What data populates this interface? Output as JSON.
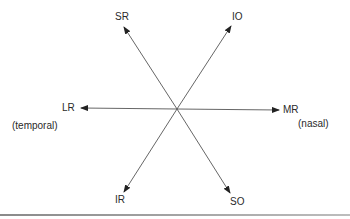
{
  "diagram": {
    "type": "extraocular-muscle-actions",
    "center": {
      "x": 177,
      "y": 109
    },
    "colors": {
      "line": "#555555",
      "arrowhead": "#222222",
      "text": "#2a2a2a"
    },
    "arrows": [
      {
        "id": "sr",
        "label": "SR",
        "tip": {
          "x": 124,
          "y": 27
        }
      },
      {
        "id": "io",
        "label": "IO",
        "tip": {
          "x": 231,
          "y": 26
        }
      },
      {
        "id": "lr",
        "label": "LR",
        "tip": {
          "x": 81,
          "y": 108
        }
      },
      {
        "id": "mr",
        "label": "MR",
        "tip": {
          "x": 279,
          "y": 110
        }
      },
      {
        "id": "ir",
        "label": "IR",
        "tip": {
          "x": 124,
          "y": 192
        }
      },
      {
        "id": "so",
        "label": "SO",
        "tip": {
          "x": 230,
          "y": 193
        }
      }
    ],
    "side_labels": {
      "temporal": "(temporal)",
      "nasal": "(nasal)"
    }
  }
}
